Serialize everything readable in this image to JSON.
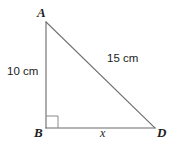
{
  "figure": {
    "kind": "right-triangle-diagram",
    "width": 178,
    "height": 145,
    "background_color": "#ffffff",
    "stroke_color": "#6a6a6a",
    "stroke_width": 1,
    "text_color": "#1c1c1c",
    "vertices": {
      "A": {
        "label": "A",
        "x": 46,
        "y": 22
      },
      "B": {
        "label": "B",
        "x": 46,
        "y": 128
      },
      "D": {
        "label": "D",
        "x": 155,
        "y": 128
      }
    },
    "sides": {
      "vertical_leg": {
        "from": "A",
        "to": "B",
        "label": "10 cm"
      },
      "hypotenuse": {
        "from": "A",
        "to": "D",
        "label": "15 cm"
      },
      "base": {
        "from": "B",
        "to": "D",
        "label": "x"
      }
    },
    "right_angle": {
      "at_vertex": "B",
      "marker": "square",
      "size": 12
    }
  }
}
